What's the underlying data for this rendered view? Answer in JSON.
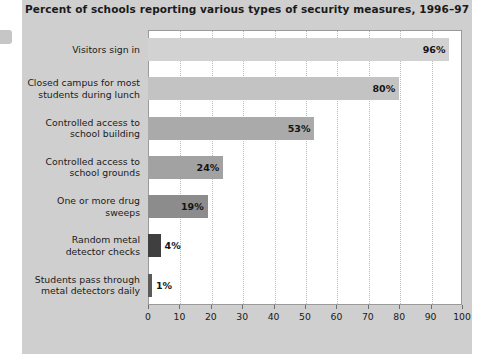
{
  "chart_data": {
    "type": "bar",
    "orientation": "horizontal",
    "title": "Percent of schools reporting various types of security measures, 1996–97",
    "xlabel": "",
    "ylabel": "",
    "xlim": [
      0,
      100
    ],
    "xticks": [
      0,
      10,
      20,
      30,
      40,
      50,
      60,
      70,
      80,
      90,
      100
    ],
    "grid": "vertical-dotted",
    "legend": "none",
    "categories": [
      "Visitors sign in",
      "Closed campus for most students during lunch",
      "Controlled access to school building",
      "Controlled access to school grounds",
      "One or more drug sweeps",
      "Random metal detector checks",
      "Students pass through metal detectors daily"
    ],
    "values": [
      96,
      80,
      53,
      24,
      19,
      4,
      1
    ],
    "value_labels": [
      "96%",
      "80%",
      "53%",
      "24%",
      "19%",
      "4%",
      "1%"
    ],
    "bar_colors": [
      "#d2d2d2",
      "#c3c3c3",
      "#aaaaaa",
      "#a2a2a2",
      "#8c8c8c",
      "#3f3f3f",
      "#5a5a5a"
    ],
    "panel_color": "#cfcfcf",
    "plot_background": "#ffffff"
  },
  "categories_display": [
    [
      "Visitors sign in"
    ],
    [
      "Closed campus for most",
      "students during lunch"
    ],
    [
      "Controlled access to",
      "school building"
    ],
    [
      "Controlled access to",
      "school grounds"
    ],
    [
      "One or more drug",
      "sweeps"
    ],
    [
      "Random metal",
      "detector checks"
    ],
    [
      "Students pass through",
      "metal detectors daily"
    ]
  ]
}
